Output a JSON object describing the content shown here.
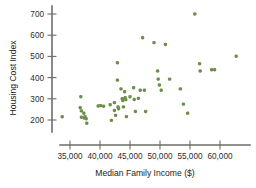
{
  "chart_data": {
    "type": "scatter",
    "title": "",
    "xlabel": "Median Family Income ($)",
    "ylabel": "Housing Cost Index",
    "grid": false,
    "legend": null,
    "marker_color": "#6d8f4a",
    "axis_color": "#6d6d68",
    "xlim": [
      32000,
      65500
    ],
    "ylim": [
      160,
      730
    ],
    "xticks": [
      35000,
      40000,
      45000,
      50000,
      55000,
      60000
    ],
    "xticklabels": [
      "35,000",
      "40,000",
      "45,000",
      "50,000",
      "55,000",
      "60,000"
    ],
    "yticks": [
      200,
      300,
      400,
      500,
      600,
      700
    ],
    "yticklabels": [
      "200",
      "300",
      "400",
      "500",
      "600",
      "700"
    ],
    "points": [
      {
        "x": 33700,
        "y": 215
      },
      {
        "x": 36800,
        "y": 310
      },
      {
        "x": 36700,
        "y": 258
      },
      {
        "x": 36900,
        "y": 243
      },
      {
        "x": 36900,
        "y": 213
      },
      {
        "x": 37300,
        "y": 232
      },
      {
        "x": 37400,
        "y": 209
      },
      {
        "x": 37500,
        "y": 215
      },
      {
        "x": 37700,
        "y": 206
      },
      {
        "x": 37800,
        "y": 185
      },
      {
        "x": 39700,
        "y": 266
      },
      {
        "x": 40100,
        "y": 268
      },
      {
        "x": 40600,
        "y": 265
      },
      {
        "x": 41700,
        "y": 272
      },
      {
        "x": 41900,
        "y": 198
      },
      {
        "x": 42400,
        "y": 282
      },
      {
        "x": 42400,
        "y": 245
      },
      {
        "x": 42600,
        "y": 222
      },
      {
        "x": 42900,
        "y": 470
      },
      {
        "x": 42900,
        "y": 388
      },
      {
        "x": 43000,
        "y": 262
      },
      {
        "x": 43100,
        "y": 253
      },
      {
        "x": 43500,
        "y": 347
      },
      {
        "x": 43700,
        "y": 301
      },
      {
        "x": 43800,
        "y": 292
      },
      {
        "x": 43900,
        "y": 262
      },
      {
        "x": 44100,
        "y": 333
      },
      {
        "x": 44200,
        "y": 305
      },
      {
        "x": 44300,
        "y": 296
      },
      {
        "x": 44400,
        "y": 216
      },
      {
        "x": 45000,
        "y": 310
      },
      {
        "x": 45600,
        "y": 352
      },
      {
        "x": 45700,
        "y": 297
      },
      {
        "x": 45900,
        "y": 240
      },
      {
        "x": 46400,
        "y": 302
      },
      {
        "x": 46700,
        "y": 340
      },
      {
        "x": 47100,
        "y": 588
      },
      {
        "x": 47400,
        "y": 340
      },
      {
        "x": 47600,
        "y": 240
      },
      {
        "x": 49000,
        "y": 565
      },
      {
        "x": 49600,
        "y": 431
      },
      {
        "x": 49700,
        "y": 393
      },
      {
        "x": 49900,
        "y": 365
      },
      {
        "x": 50200,
        "y": 340
      },
      {
        "x": 50900,
        "y": 556
      },
      {
        "x": 51600,
        "y": 393
      },
      {
        "x": 53400,
        "y": 347
      },
      {
        "x": 53900,
        "y": 275
      },
      {
        "x": 54600,
        "y": 232
      },
      {
        "x": 55800,
        "y": 700
      },
      {
        "x": 56600,
        "y": 465
      },
      {
        "x": 56700,
        "y": 431
      },
      {
        "x": 58600,
        "y": 437
      },
      {
        "x": 59100,
        "y": 437
      },
      {
        "x": 62700,
        "y": 501
      }
    ]
  }
}
